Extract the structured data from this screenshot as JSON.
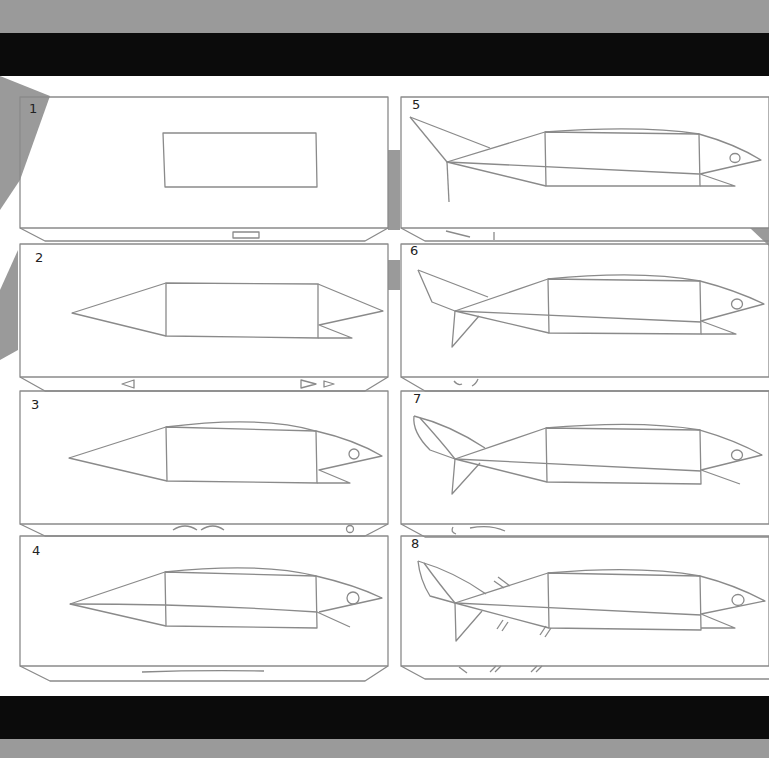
{
  "colors": {
    "background": "#9a9a9a",
    "bars": "#0b0b0b",
    "paper": "#ffffff",
    "stroke": "#8a8a8a",
    "number": "#222222"
  },
  "panels": [
    {
      "number": "1",
      "description": "Rectangle body block",
      "column": "left",
      "row": 1
    },
    {
      "number": "2",
      "description": "Add pointed tail cone and split mouth",
      "column": "left",
      "row": 2
    },
    {
      "number": "3",
      "description": "Curve the head top and add eye",
      "column": "left",
      "row": 3
    },
    {
      "number": "4",
      "description": "Add lateral midline",
      "column": "left",
      "row": 4
    },
    {
      "number": "5",
      "description": "Add tail fin upper lobe",
      "column": "right",
      "row": 1
    },
    {
      "number": "6",
      "description": "Add tail fin lower lobe",
      "column": "right",
      "row": 2
    },
    {
      "number": "7",
      "description": "Refine tail fin shape",
      "column": "right",
      "row": 3
    },
    {
      "number": "8",
      "description": "Add fin rays / detail strokes",
      "column": "right",
      "row": 4
    }
  ]
}
